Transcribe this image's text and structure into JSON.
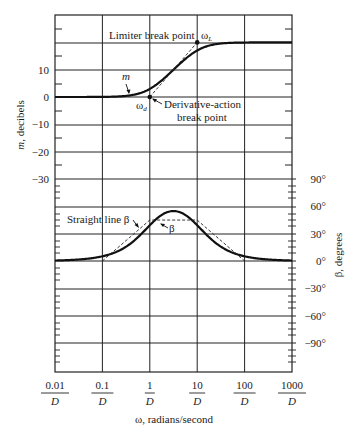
{
  "chart_data": {
    "type": "line",
    "title": "",
    "xlabel": "ω, radians/second",
    "ylabel_left": "m, decibels",
    "ylabel_right": "β, degrees",
    "x_scale": "log",
    "x_ticks": [
      {
        "num": "0.01",
        "den": "D",
        "value": 0.01
      },
      {
        "num": "0.1",
        "den": "D",
        "value": 0.1
      },
      {
        "num": "1",
        "den": "D",
        "value": 1
      },
      {
        "num": "10",
        "den": "D",
        "value": 10
      },
      {
        "num": "100",
        "den": "D",
        "value": 100
      },
      {
        "num": "1000",
        "den": "D",
        "value": 1000
      }
    ],
    "left_axis": {
      "ticks": [
        "10",
        "0",
        "−10",
        "−20",
        "−30"
      ],
      "tick_values": [
        10,
        0,
        -10,
        -20,
        -30
      ],
      "ylim": [
        -40,
        25
      ]
    },
    "right_axis": {
      "ticks": [
        "90°",
        "60°",
        "30°",
        "0°",
        "−30°",
        "−60°",
        "−90°"
      ],
      "tick_values": [
        90,
        60,
        30,
        0,
        -30,
        -60,
        -90
      ],
      "ylim": [
        -120,
        90
      ]
    },
    "grid": true,
    "series": [
      {
        "name": "m",
        "axis": "left",
        "style": "solid-thick",
        "x": [
          0.01,
          0.1,
          0.5,
          1,
          2,
          3.16,
          5,
          10,
          20,
          50,
          100,
          1000
        ],
        "values": [
          0,
          0.04,
          1,
          3,
          7,
          10,
          13,
          17,
          19,
          19.9,
          20,
          20
        ]
      },
      {
        "name": "m asymptote",
        "axis": "left",
        "style": "dashed",
        "x": [
          0.01,
          1,
          10,
          1000
        ],
        "values": [
          0,
          0,
          20,
          20
        ]
      },
      {
        "name": "β",
        "axis": "right",
        "style": "solid-thick",
        "x": [
          0.01,
          0.1,
          0.3,
          1,
          2,
          3.16,
          5,
          10,
          30,
          100,
          1000
        ],
        "values": [
          0.6,
          5.7,
          16,
          39,
          52,
          55,
          52,
          39,
          16,
          5.7,
          0.6
        ]
      },
      {
        "name": "Straight line β",
        "axis": "right",
        "style": "dashed",
        "x": [
          0.1,
          1,
          10,
          100
        ],
        "values": [
          0,
          45,
          45,
          0
        ]
      }
    ],
    "annotations": [
      {
        "text": "Limiter break point",
        "target": "ωL"
      },
      {
        "text": "ωL",
        "main": "ω",
        "sub": "L"
      },
      {
        "text": "m"
      },
      {
        "text": "ωd",
        "main": "ω",
        "sub": "d"
      },
      {
        "text": "Derivative-action",
        "line2": "break point"
      },
      {
        "text": "Straight line β"
      },
      {
        "text": "β"
      }
    ]
  },
  "labels": {
    "limiter": "Limiter break point",
    "omega": "ω",
    "omega_L_sub": "L",
    "omega_d_sub": "d",
    "m": "m",
    "deriv_line1": "Derivative-action",
    "deriv_line2": "break point",
    "straight_line_beta": "Straight line β",
    "beta": "β"
  }
}
